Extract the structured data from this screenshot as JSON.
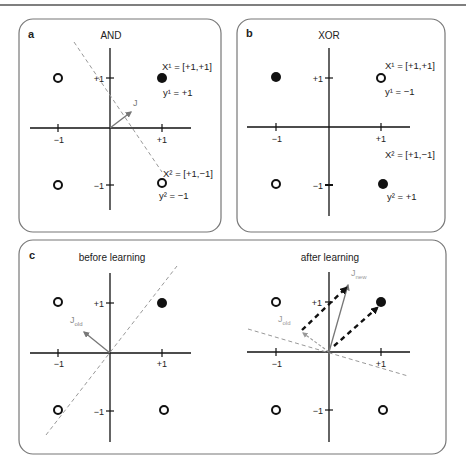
{
  "figure": {
    "panels": [
      {
        "id": "a",
        "letter": "a",
        "title": "AND",
        "ticks": {
          "x_neg": "−1",
          "x_pos": "+1",
          "y_pos": "+1",
          "y_neg": "−1"
        },
        "points": [
          {
            "x": -1,
            "y": 1,
            "filled": false
          },
          {
            "x": 1,
            "y": 1,
            "filled": true
          },
          {
            "x": -1,
            "y": -1,
            "filled": false
          },
          {
            "x": 1,
            "y": -1,
            "filled": false
          }
        ],
        "annotations": {
          "x1": "X¹ = [+1,+1]",
          "y1": "y¹ = +1",
          "x2": "X² = [+1,−1]",
          "y2": "y² = −1"
        },
        "vector_label": "J"
      },
      {
        "id": "b",
        "letter": "b",
        "title": "XOR",
        "ticks": {
          "x_neg": "−1",
          "x_pos": "+1",
          "y_pos": "+1",
          "y_neg": "−1"
        },
        "points": [
          {
            "x": -1,
            "y": 1,
            "filled": true
          },
          {
            "x": 1,
            "y": 1,
            "filled": false
          },
          {
            "x": -1,
            "y": -1,
            "filled": false
          },
          {
            "x": 1,
            "y": -1,
            "filled": true
          }
        ],
        "annotations": {
          "x1": "X¹ = [+1,+1]",
          "y1": "y¹ = −1",
          "x2": "X² = [+1,−1]",
          "y2": "y² = +1"
        }
      },
      {
        "id": "c",
        "letter": "c",
        "subpanels": [
          {
            "title": "before learning",
            "ticks": {
              "x_neg": "−1",
              "x_pos": "+1",
              "y_pos": "+1",
              "y_neg": "−1"
            },
            "vector_label": "J",
            "vector_sub": "old"
          },
          {
            "title": "after learning",
            "ticks": {
              "x_neg": "−1",
              "x_pos": "+1",
              "y_pos": "+1",
              "y_neg": "−1"
            },
            "old_label": "J",
            "old_sub": "old",
            "new_label": "J",
            "new_sub": "new"
          }
        ]
      }
    ]
  }
}
